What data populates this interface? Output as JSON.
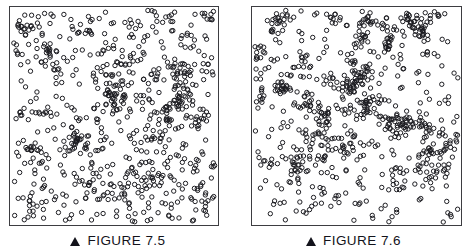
{
  "page": {
    "background_color": "#ffffff",
    "width": 471,
    "height": 250
  },
  "figures": [
    {
      "id": "figure-7-5",
      "marker_icon": "solid-up-triangle-icon",
      "caption": "FIGURE 7.5",
      "panel": {
        "border_color": "#3d3d41",
        "background_color": "#ffffff",
        "point_color": "#1b1b20"
      }
    },
    {
      "id": "figure-7-6",
      "marker_icon": "solid-up-triangle-icon",
      "caption": "FIGURE 7.6",
      "panel": {
        "border_color": "#3d3d41",
        "background_color": "#ffffff",
        "point_color": "#1b1b20"
      }
    }
  ],
  "chart_data": [
    {
      "type": "scatter",
      "title": "FIGURE 7.5",
      "xlabel": "",
      "ylabel": "",
      "xlim": [
        0,
        1
      ],
      "ylim": [
        0,
        1
      ],
      "grid": false,
      "legend": "none",
      "axis_ticks": "none",
      "marker": "open-circle",
      "marker_diameter_px": 4.4,
      "marker_stroke_px": 1,
      "marker_fill": "none",
      "marker_stroke_color": "#1b1b20",
      "n_points": 760,
      "pattern": "random-uniform-with-mild-clumping",
      "seed": 75,
      "clusters": 34,
      "cluster_fraction": 0.42,
      "cluster_spread": 0.045,
      "annotations": []
    },
    {
      "type": "scatter",
      "title": "FIGURE 7.6",
      "xlabel": "",
      "ylabel": "",
      "xlim": [
        0,
        1
      ],
      "ylim": [
        0,
        1
      ],
      "grid": false,
      "legend": "none",
      "axis_ticks": "none",
      "marker": "open-circle",
      "marker_diameter_px": 4.4,
      "marker_stroke_px": 1,
      "marker_fill": "none",
      "marker_stroke_color": "#1b1b20",
      "n_points": 790,
      "pattern": "clustered-strands-with-voids",
      "seed": 76,
      "clusters": 46,
      "cluster_fraction": 0.62,
      "cluster_spread": 0.038,
      "annotations": []
    }
  ]
}
